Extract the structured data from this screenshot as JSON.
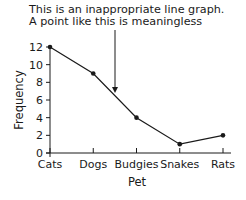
{
  "annotation": {
    "line1": "This is an inappropriate line graph.",
    "line2": "A point like this is meaningless"
  },
  "chart_data": {
    "type": "line",
    "title": "",
    "categories": [
      "Cats",
      "Dogs",
      "Budgies",
      "Snakes",
      "Rats"
    ],
    "values": [
      12,
      9,
      4,
      1,
      2
    ],
    "xlabel": "Pet",
    "ylabel": "Frequency",
    "ylim": [
      0,
      12
    ],
    "yticks": [
      0,
      2,
      4,
      6,
      8,
      10,
      12
    ],
    "grid": false,
    "legend": null,
    "annotations": [
      {
        "text": "This is an inappropriate line graph. A point like this is meaningless",
        "arrow_target": "between Dogs and Budgies on the line"
      }
    ]
  },
  "colors": {
    "line": "#1a1a1a",
    "background": "#ffffff"
  }
}
